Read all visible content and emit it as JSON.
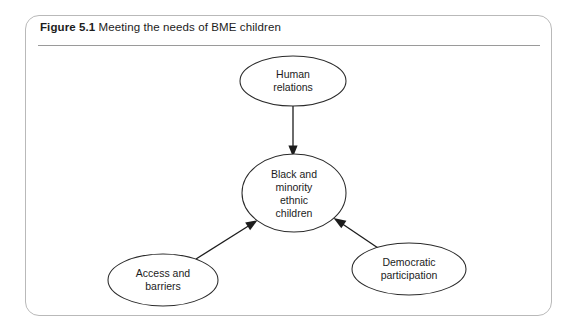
{
  "figure": {
    "caption_number": "Figure 5.1",
    "caption_text": " Meeting the needs of BME children",
    "border_color": "#b9b9b9",
    "rule_color": "#9a9a9a"
  },
  "diagram": {
    "type": "concept-map",
    "node_stroke_color": "#2a2a2a",
    "connector_color": "#1c1c1c",
    "nodes": [
      {
        "id": "human-relations",
        "lines": [
          "Human",
          "relations"
        ],
        "cx": 293,
        "cy": 81,
        "rx": 53,
        "ry": 25
      },
      {
        "id": "bme-children",
        "lines": [
          "Black and",
          "minority",
          "ethnic",
          "children"
        ],
        "cx": 294,
        "cy": 193,
        "rx": 52,
        "ry": 39
      },
      {
        "id": "access-and-barriers",
        "lines": [
          "Access and",
          "barriers"
        ],
        "cx": 163,
        "cy": 280,
        "rx": 55,
        "ry": 26
      },
      {
        "id": "democratic-participation",
        "lines": [
          "Democratic",
          "participation"
        ],
        "cx": 409,
        "cy": 269,
        "rx": 57,
        "ry": 26
      }
    ],
    "connectors": [
      {
        "id": "human-relations-to-bme",
        "from": "human-relations",
        "to": "bme-children"
      },
      {
        "id": "access-and-barriers-to-bme",
        "from": "access-and-barriers",
        "to": "bme-children"
      },
      {
        "id": "democratic-participation-to-bme",
        "from": "democratic-participation",
        "to": "bme-children"
      }
    ]
  }
}
